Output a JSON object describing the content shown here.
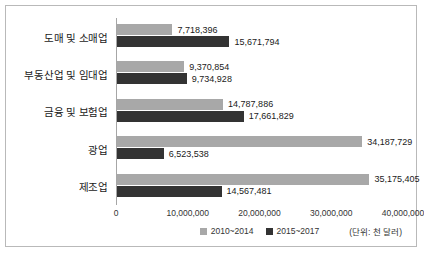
{
  "chart_data": {
    "type": "bar",
    "orientation": "horizontal",
    "title": "",
    "subtitle": "",
    "xlabel": "",
    "ylabel": "",
    "xlim": [
      0,
      40000000
    ],
    "grid": false,
    "legend_position": "bottom-center",
    "unit_note": "(단위: 천 달러)",
    "categories": [
      "도매 및 소매업",
      "부동산업 및 임대업",
      "금융 및 보험업",
      "광업",
      "제조업"
    ],
    "xticks": [
      0,
      10000000,
      20000000,
      30000000,
      40000000
    ],
    "xtick_labels": [
      "0",
      "10,000,000",
      "20,000,000",
      "30,000,000",
      "40,000,000"
    ],
    "series": [
      {
        "name": "2010~2014",
        "color": "#a8a8a8",
        "values": [
          7718396,
          9370854,
          14787886,
          34187729,
          35175405
        ],
        "value_labels": [
          "7,718,396",
          "9,370,854",
          "14,787,886",
          "34,187,729",
          "35,175,405"
        ]
      },
      {
        "name": "2015~2017",
        "color": "#333333",
        "values": [
          15671794,
          9734928,
          17661829,
          6523538,
          14567481
        ],
        "value_labels": [
          "15,671,794",
          "9,734,928",
          "17,661,829",
          "6,523,538",
          "14,567,481"
        ]
      }
    ]
  }
}
